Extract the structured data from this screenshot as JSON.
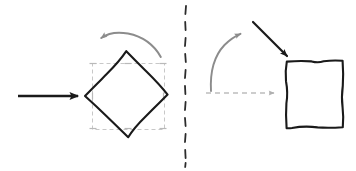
{
  "canvas": {
    "width": 356,
    "height": 171,
    "background_color": "#ffffff",
    "title": "Rotation transform diagram"
  },
  "colors": {
    "stroke_black": "#1a1a1a",
    "stroke_gray": "#8c8c8c",
    "stroke_gray_light": "#bdbdbd",
    "selection_box": "#c8c8c8",
    "divider": "#2b2b2b",
    "background": "#ffffff"
  },
  "left_panel": {
    "name": "rotated-shape-panel",
    "input_arrow": {
      "name": "input-arrow",
      "label": "",
      "color": "#1a1a1a",
      "direction": "right",
      "x1": 18,
      "y1": 96,
      "x2": 84,
      "y2": 96
    },
    "rotation_arrow": {
      "name": "rotation-arrow",
      "label": "",
      "color": "#8c8c8c",
      "direction": "counterclockwise",
      "arrowhead_at": "left"
    },
    "shape": {
      "name": "rotated-square-shape",
      "label": "",
      "type": "square",
      "rotation_degrees": 45,
      "stroke_color": "#1a1a1a",
      "fill": "none",
      "vertices": [
        [
          126,
          51
        ],
        [
          168,
          95
        ],
        [
          128,
          137
        ],
        [
          85,
          96
        ]
      ]
    },
    "selection_box": {
      "name": "selection-bounding-box",
      "label": "",
      "stroke_color": "#c8c8c8",
      "dashed": true,
      "x": 92,
      "y": 63,
      "width": 72,
      "height": 66,
      "handles": 8
    }
  },
  "divider": {
    "name": "panel-divider",
    "label": "",
    "color": "#2b2b2b",
    "dashed": true,
    "x": 185,
    "y1": 6,
    "y2": 166
  },
  "right_panel": {
    "name": "upright-shape-panel",
    "curved_arrow": {
      "name": "curved-up-arrow",
      "label": "",
      "color": "#8c8c8c",
      "direction": "up-right",
      "arrowhead_at": "top-right"
    },
    "pointer_arrow": {
      "name": "pointer-arrow",
      "label": "",
      "color": "#1a1a1a",
      "direction": "down-right",
      "x1": 253,
      "y1": 22,
      "x2": 288,
      "y2": 60
    },
    "dashed_arrow": {
      "name": "dashed-transition-arrow",
      "label": "",
      "color": "#bdbdbd",
      "dashed": true,
      "direction": "right",
      "x1": 206,
      "y1": 93,
      "x2": 280,
      "y2": 93
    },
    "shape": {
      "name": "upright-square-shape",
      "label": "",
      "type": "square",
      "rotation_degrees": 0,
      "stroke_color": "#1a1a1a",
      "fill": "none",
      "x": 286,
      "y": 61,
      "width": 57,
      "height": 66
    }
  }
}
